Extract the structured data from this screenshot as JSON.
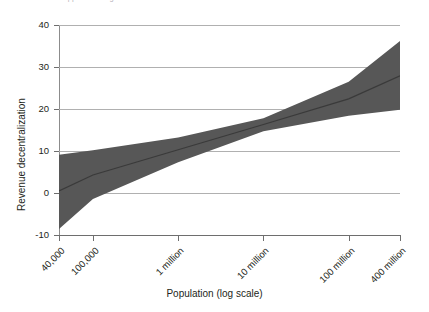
{
  "page_header": {
    "page_number": "212",
    "title_fragment": "clipped running head"
  },
  "chart_data": {
    "type": "line",
    "title": "",
    "xlabel": "Population (log scale)",
    "ylabel": "Revenue decentralization",
    "xscale": "log",
    "grid": true,
    "legend": "none",
    "ylim": [
      -10,
      40
    ],
    "yticks": [
      40,
      30,
      20,
      10,
      0,
      -10
    ],
    "ytick_labels": [
      "40",
      "30",
      "20",
      "10",
      "0",
      "-10"
    ],
    "xticks": [
      40000,
      100000,
      1000000,
      10000000,
      100000000,
      400000000
    ],
    "xtick_labels": [
      "40,000",
      "100,000",
      "1 million",
      "10 million",
      "100 million",
      "400 million"
    ],
    "series": [
      {
        "name": "Predicted revenue decentralization",
        "kind": "line",
        "color": "#3a3a3a",
        "x": [
          40000,
          100000,
          1000000,
          10000000,
          100000000,
          400000000
        ],
        "values": [
          0.5,
          4.3,
          10.3,
          16.3,
          22.4,
          27.9
        ]
      },
      {
        "name": "95% confidence interval",
        "kind": "band",
        "color": "#575757",
        "x": [
          40000,
          100000,
          1000000,
          10000000,
          100000000,
          400000000
        ],
        "upper": [
          9.1,
          10.2,
          13.2,
          17.8,
          26.5,
          36.2
        ],
        "lower": [
          -8.6,
          -1.4,
          7.3,
          14.7,
          18.4,
          19.8
        ]
      }
    ]
  },
  "colors": {
    "band": "#575757",
    "line": "#3a3a3a",
    "grid": "#b0b0b0",
    "axis": "#6e6e6e",
    "text": "#231f20"
  }
}
